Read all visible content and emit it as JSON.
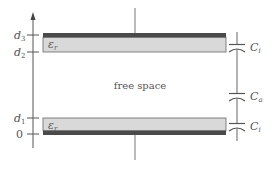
{
  "axis": {
    "ticks": [
      {
        "id": "d3",
        "base": "d",
        "sub": "3"
      },
      {
        "id": "d2",
        "base": "d",
        "sub": "2"
      },
      {
        "id": "d1",
        "base": "d",
        "sub": "1"
      },
      {
        "id": "zero",
        "base": "0",
        "sub": ""
      }
    ]
  },
  "slabs": {
    "top": {
      "label_base": "ε",
      "label_sub": "r"
    },
    "bottom": {
      "label_base": "ε",
      "label_sub": "r"
    }
  },
  "region_label": "free space",
  "capacitors": [
    {
      "id": "ci-top",
      "base": "C",
      "sub": "i"
    },
    {
      "id": "ca",
      "base": "C",
      "sub": "a"
    },
    {
      "id": "ci-bottom",
      "base": "C",
      "sub": "i"
    }
  ],
  "colors": {
    "line": "#555555",
    "dielectric": "#d9d9d9",
    "electrode": "#4a4a4a"
  }
}
